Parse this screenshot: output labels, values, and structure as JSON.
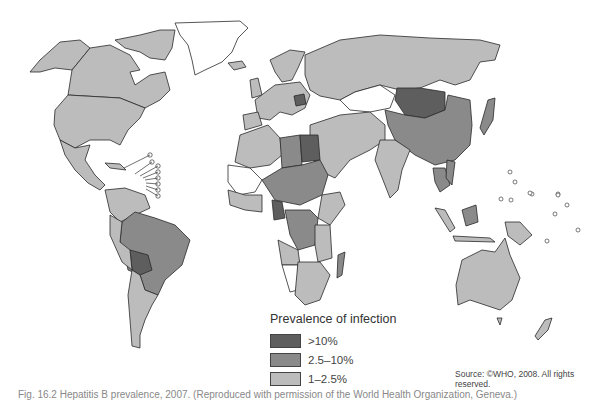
{
  "figure": {
    "colors": {
      "gt10": "#5e5e5e",
      "2_5to10": "#8a8a8a",
      "1to2_5": "#bcbcbc",
      "none": "#ffffff",
      "border": "#2a2a2a"
    }
  },
  "legend": {
    "title": "Prevalence of infection",
    "items": [
      {
        "label": ">10%",
        "color": "#5e5e5e"
      },
      {
        "label": "2.5–10%",
        "color": "#8a8a8a"
      },
      {
        "label": "1–2.5%",
        "color": "#bcbcbc"
      }
    ]
  },
  "source": "Source: ©WHO, 2008. All rights reserved.",
  "caption": "Fig. 16.2  Hepatitis B prevalence, 2007. (Reproduced with permission of the World Health Organization, Geneva.)",
  "regions": {
    "gt10": [
      "Mongolia",
      "Bolivia",
      "Egypt",
      "Romania/Moldova",
      "Cameroon",
      "Sierra Leone/Liberia"
    ],
    "2_5to10": [
      "China",
      "Brazil",
      "Libya",
      "Chad",
      "Sudan",
      "DR Congo",
      "Madagascar",
      "Thailand",
      "Vietnam",
      "Malaysia (Borneo)"
    ],
    "1to2_5": [
      "Canada",
      "USA",
      "Mexico",
      "Argentina",
      "Russia",
      "India",
      "Australia",
      "Europe",
      "Southern Africa",
      "Saudi Arabia"
    ],
    "none_shown": [
      "Greenland",
      "Kazakhstan",
      "Namibia",
      "Mauritania/Mali"
    ]
  }
}
